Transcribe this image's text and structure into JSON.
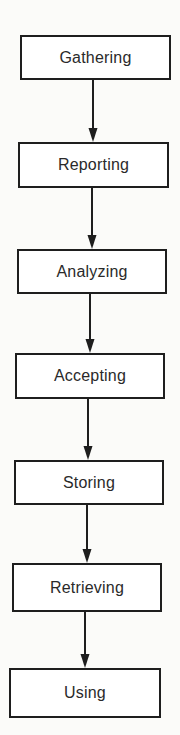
{
  "diagram": {
    "type": "vertical-flowchart",
    "colors": {
      "stroke": "#1e1e1e",
      "text": "#2a2a2a",
      "background": "#fbfbf9",
      "node_fill": "#ffffff"
    },
    "nodes": [
      {
        "id": "gathering",
        "label": "Gathering",
        "x": 20,
        "y": 35,
        "w": 151,
        "h": 45
      },
      {
        "id": "reporting",
        "label": "Reporting",
        "x": 18,
        "y": 142,
        "w": 151,
        "h": 46
      },
      {
        "id": "analyzing",
        "label": "Analyzing",
        "x": 17,
        "y": 249,
        "w": 150,
        "h": 45
      },
      {
        "id": "accepting",
        "label": "Accepting",
        "x": 15,
        "y": 353,
        "w": 150,
        "h": 46
      },
      {
        "id": "storing",
        "label": "Storing",
        "x": 14,
        "y": 460,
        "w": 150,
        "h": 45
      },
      {
        "id": "retrieving",
        "label": "Retrieving",
        "x": 12,
        "y": 563,
        "w": 150,
        "h": 49
      },
      {
        "id": "using",
        "label": "Using",
        "x": 9,
        "y": 668,
        "w": 152,
        "h": 50
      }
    ],
    "edges": [
      {
        "from": "gathering",
        "to": "reporting",
        "x": 93,
        "y1": 80,
        "y2": 142
      },
      {
        "from": "reporting",
        "to": "analyzing",
        "x": 92,
        "y1": 188,
        "y2": 249
      },
      {
        "from": "analyzing",
        "to": "accepting",
        "x": 90,
        "y1": 294,
        "y2": 353
      },
      {
        "from": "accepting",
        "to": "storing",
        "x": 88,
        "y1": 399,
        "y2": 460
      },
      {
        "from": "storing",
        "to": "retrieving",
        "x": 87,
        "y1": 505,
        "y2": 563
      },
      {
        "from": "retrieving",
        "to": "using",
        "x": 85,
        "y1": 612,
        "y2": 668
      }
    ]
  }
}
